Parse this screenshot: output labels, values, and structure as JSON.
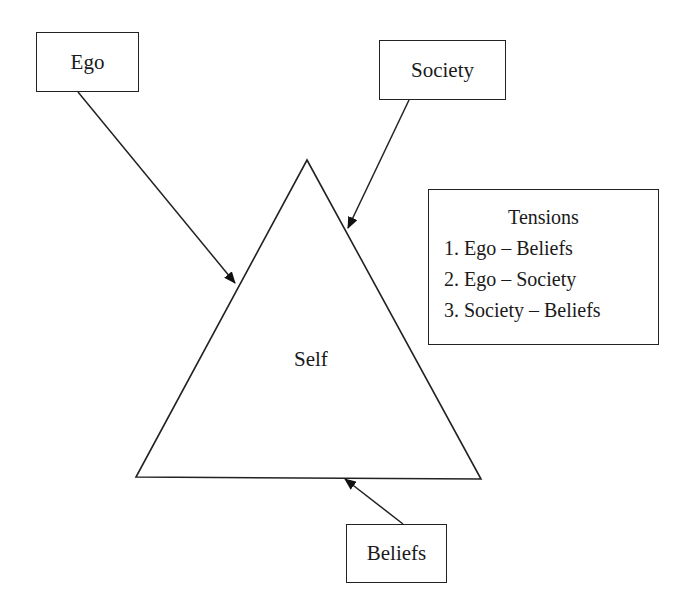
{
  "diagram": {
    "center": {
      "label": "Self",
      "shape": "triangle"
    },
    "nodes": [
      {
        "id": "ego",
        "label": "Ego"
      },
      {
        "id": "society",
        "label": "Society"
      },
      {
        "id": "beliefs",
        "label": "Beliefs"
      }
    ],
    "edges": [
      {
        "from": "Ego",
        "to": "Self"
      },
      {
        "from": "Society",
        "to": "Self"
      },
      {
        "from": "Beliefs",
        "to": "Self"
      }
    ],
    "legend": {
      "title": "Tensions",
      "items": [
        "1. Ego – Beliefs",
        "2. Ego – Society",
        "3. Society – Beliefs"
      ]
    }
  },
  "colors": {
    "stroke": "#222222",
    "background": "#ffffff"
  }
}
